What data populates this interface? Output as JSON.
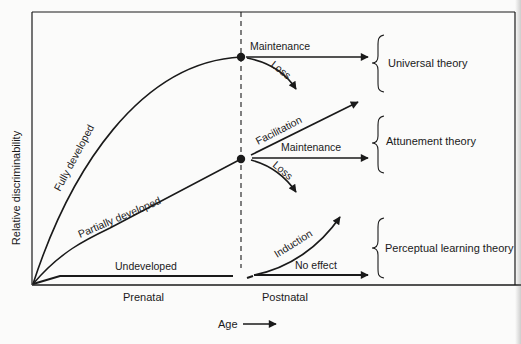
{
  "figure": {
    "y_axis_label": "Relative discriminability",
    "x_axis_label": "Age",
    "x_axis_arrow": "right-arrow",
    "period_labels": {
      "prenatal": "Prenatal",
      "postnatal": "Postnatal"
    },
    "curves": {
      "fully": "Fully developed",
      "partially": "Partially developed",
      "undeveloped": "Undeveloped"
    },
    "outcomes": {
      "top_maintenance": "Maintenance",
      "top_loss": "Loss",
      "mid_facilitation": "Facilitation",
      "mid_maintenance": "Maintenance",
      "mid_loss": "Loss",
      "low_induction": "Induction",
      "low_no_effect": "No effect"
    },
    "theories": {
      "universal": "Universal theory",
      "attunement": "Attunement theory",
      "perceptual": "Perceptual learning theory"
    },
    "colors": {
      "ink": "#1a1a1a",
      "paper": "#fbfbfa"
    }
  }
}
